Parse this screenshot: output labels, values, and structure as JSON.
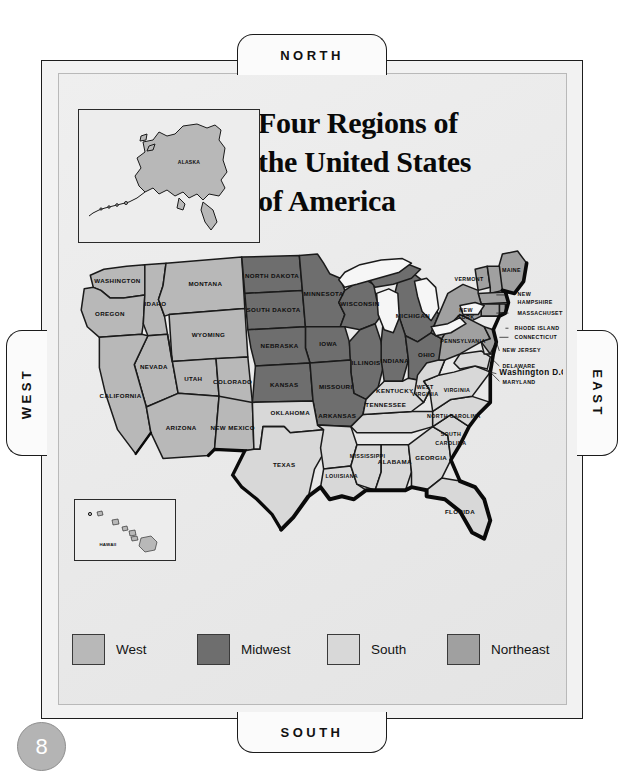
{
  "page_number": "8",
  "direction_tabs": {
    "north": "NORTH",
    "south": "SOUTH",
    "west": "WEST",
    "east": "EAST"
  },
  "title": {
    "line1": "Four Regions of",
    "line2": "the United States",
    "line3": "of America"
  },
  "legend": {
    "items": [
      {
        "label": "West",
        "color": "#b8b8b8"
      },
      {
        "label": "Midwest",
        "color": "#6e6e6e"
      },
      {
        "label": "South",
        "color": "#d8d8d8"
      },
      {
        "label": "Northeast",
        "color": "#a0a0a0"
      }
    ]
  },
  "insets": {
    "alaska": {
      "label": "ALASKA",
      "region": "West"
    },
    "hawaii": {
      "label": "HAWAII",
      "region": "West"
    }
  },
  "map": {
    "regions": {
      "west": {
        "name": "West",
        "color": "#b8b8b8",
        "states": [
          "WASHINGTON",
          "OREGON",
          "IDAHO",
          "MONTANA",
          "WYOMING",
          "NEVADA",
          "UTAH",
          "COLORADO",
          "CALIFORNIA",
          "ARIZONA",
          "NEW MEXICO",
          "ALASKA",
          "HAWAII"
        ]
      },
      "midwest": {
        "name": "Midwest",
        "color": "#6e6e6e",
        "states": [
          "NORTH DAKOTA",
          "SOUTH DAKOTA",
          "MINNESOTA",
          "WISCONSIN",
          "MICHIGAN",
          "IOWA",
          "NEBRASKA",
          "ILLINOIS",
          "INDIANA",
          "OHIO",
          "KANSAS",
          "MISSOURI"
        ]
      },
      "south": {
        "name": "South",
        "color": "#d8d8d8",
        "states": [
          "OKLAHOMA",
          "TEXAS",
          "ARKANSAS",
          "LOUISIANA",
          "MISSISSIPPI",
          "ALABAMA",
          "TENNESSEE",
          "KENTUCKY",
          "GEORGIA",
          "FLORIDA",
          "SOUTH CAROLINA",
          "NORTH CAROLINA",
          "VIRGINIA",
          "WEST VIRGINIA",
          "MARYLAND",
          "DELAWARE"
        ]
      },
      "northeast": {
        "name": "Northeast",
        "color": "#a0a0a0",
        "states": [
          "MAINE",
          "VERMONT",
          "NEW HAMPSHIRE",
          "MASSACHUSETTS",
          "RHODE ISLAND",
          "CONNECTICUT",
          "NEW YORK",
          "PENNSYLVANIA",
          "NEW JERSEY"
        ]
      }
    },
    "capital_label": "Washington D.C.",
    "labels": {
      "washington": "WASHINGTON",
      "oregon": "OREGON",
      "idaho": "IDAHO",
      "montana": "MONTANA",
      "wyoming": "WYOMING",
      "nevada": "NEVADA",
      "utah": "UTAH",
      "colorado": "COLORADO",
      "california": "CALIFORNIA",
      "arizona": "ARIZONA",
      "new_mexico": "NEW MEXICO",
      "north_dakota": "NORTH DAKOTA",
      "south_dakota": "SOUTH DAKOTA",
      "minnesota": "MINNESOTA",
      "wisconsin": "WISCONSIN",
      "michigan": "MICHIGAN",
      "iowa": "IOWA",
      "nebraska": "NEBRASKA",
      "illinois": "ILLINOIS",
      "indiana": "INDIANA",
      "ohio": "OHIO",
      "kansas": "KANSAS",
      "missouri": "MISSOURI",
      "oklahoma": "OKLAHOMA",
      "texas": "TEXAS",
      "arkansas": "ARKANSAS",
      "louisiana": "LOUISIANA",
      "mississippi": "MISSISSIPPI",
      "alabama": "ALABAMA",
      "tennessee": "TENNESSEE",
      "kentucky": "KENTUCKY",
      "georgia": "GEORGIA",
      "florida": "FLORIDA",
      "south_carolina_1": "SOUTH",
      "south_carolina_2": "CAROLINA",
      "north_carolina": "NORTH CAROLINA",
      "virginia": "VIRGINIA",
      "west_virginia_1": "WEST",
      "west_virginia_2": "VIRGINIA",
      "maryland": "MARYLAND",
      "delaware": "DELAWARE",
      "new_jersey": "NEW JERSEY",
      "pennsylvania": "PENNSYLVANIA",
      "new_york_1": "NEW",
      "new_york_2": "YORK",
      "vermont": "VERMONT",
      "maine": "MAINE",
      "new_hampshire_1": "NEW",
      "new_hampshire_2": "HAMPSHIRE",
      "massachusetts": "MASSACHUSETTS",
      "rhode_island": "RHODE ISLAND",
      "connecticut": "CONNECTICUT"
    }
  }
}
